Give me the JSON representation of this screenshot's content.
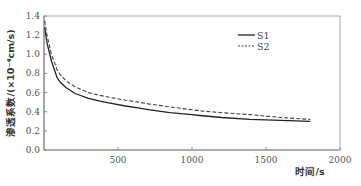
{
  "chart_data": {
    "type": "line",
    "title": "",
    "xlabel": "时间/s",
    "ylabel": "渗透系数/(×10⁻⁴cm/s)",
    "xlim": [
      0,
      2000
    ],
    "ylim": [
      0.0,
      1.4
    ],
    "xticks": [
      500,
      1000,
      1500,
      2000
    ],
    "xtick_labels": [
      "500",
      "1000",
      "1500",
      "2000"
    ],
    "yticks": [
      0.0,
      0.2,
      0.4,
      0.6,
      0.8,
      1.0,
      1.2,
      1.4
    ],
    "ytick_labels": [
      "0.0",
      "0.2",
      "0.4",
      "0.6",
      "0.8",
      "1.0",
      "1.2",
      "1.4"
    ],
    "grid": false,
    "legend_position": "upper right (inside)",
    "series": [
      {
        "name": "S1",
        "style": "solid",
        "color": "#222222",
        "x": [
          5,
          20,
          50,
          88,
          108,
          150,
          210,
          300,
          378,
          446,
          550,
          635,
          716,
          850,
          1000,
          1054,
          1200,
          1392,
          1600,
          1800
        ],
        "y": [
          1.28,
          1.12,
          0.93,
          0.76,
          0.71,
          0.65,
          0.59,
          0.54,
          0.51,
          0.49,
          0.46,
          0.44,
          0.42,
          0.39,
          0.37,
          0.36,
          0.34,
          0.32,
          0.31,
          0.3
        ]
      },
      {
        "name": "S2",
        "style": "dashed",
        "color": "#444444",
        "x": [
          5,
          20,
          50,
          88,
          108,
          150,
          210,
          300,
          378,
          446,
          550,
          635,
          716,
          850,
          1000,
          1054,
          1200,
          1392,
          1600,
          1800
        ],
        "y": [
          1.35,
          1.2,
          1.0,
          0.84,
          0.79,
          0.72,
          0.66,
          0.6,
          0.57,
          0.55,
          0.52,
          0.5,
          0.48,
          0.45,
          0.42,
          0.41,
          0.39,
          0.37,
          0.34,
          0.32
        ]
      }
    ]
  },
  "style": {
    "axis_color": "#888888",
    "frame_color": "#aaaaaa"
  }
}
